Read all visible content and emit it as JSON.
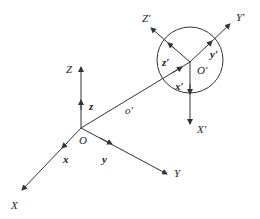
{
  "diagram": {
    "title": "",
    "labels": {
      "Z": "Z",
      "X": "X",
      "Y": "Y",
      "O": "O",
      "z": "z",
      "x": "x",
      "y": "y",
      "o_prime": "o′",
      "Z_prime": "Z′",
      "Y_prime": "Y′",
      "X_prime": "X′",
      "z_prime": "z′",
      "y_prime": "y′",
      "x_prime": "x′",
      "O_prime": "O′"
    },
    "colors": {
      "line": "#333333",
      "background": "#ffffff"
    }
  }
}
